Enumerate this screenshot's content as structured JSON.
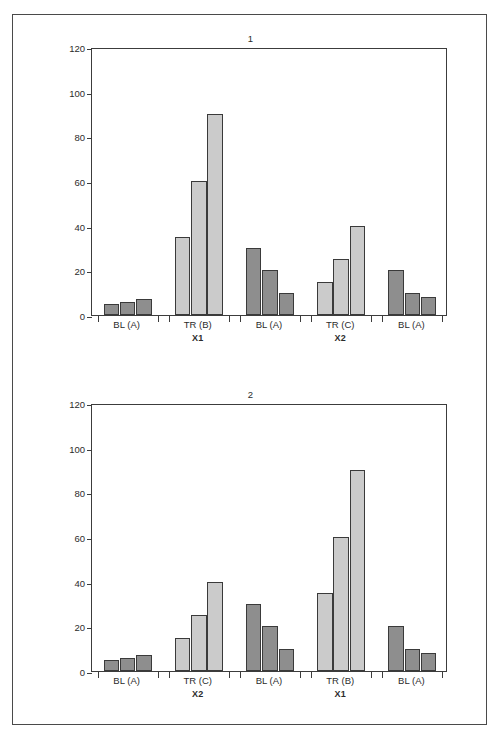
{
  "figure": {
    "panels": [
      {
        "title": "1",
        "y_axis": {
          "min": 0,
          "max": 120,
          "step": 20,
          "ticks": [
            "0",
            "20",
            "40",
            "60",
            "80",
            "100",
            "120"
          ]
        },
        "groups": [
          {
            "label": "BL (A)",
            "sub": "",
            "shade": "dark",
            "values": [
              5,
              6,
              7
            ]
          },
          {
            "label": "TR (B)",
            "sub": "X1",
            "shade": "light",
            "values": [
              35,
              60,
              90
            ]
          },
          {
            "label": "BL (A)",
            "sub": "",
            "shade": "dark",
            "values": [
              30,
              20,
              10
            ]
          },
          {
            "label": "TR (C)",
            "sub": "X2",
            "shade": "light",
            "values": [
              15,
              25,
              40
            ]
          },
          {
            "label": "BL (A)",
            "sub": "",
            "shade": "dark",
            "values": [
              20,
              10,
              8
            ]
          }
        ]
      },
      {
        "title": "2",
        "y_axis": {
          "min": 0,
          "max": 120,
          "step": 20,
          "ticks": [
            "0",
            "20",
            "40",
            "60",
            "80",
            "100",
            "120"
          ]
        },
        "groups": [
          {
            "label": "BL (A)",
            "sub": "",
            "shade": "dark",
            "values": [
              5,
              6,
              7
            ]
          },
          {
            "label": "TR (C)",
            "sub": "X2",
            "shade": "light",
            "values": [
              15,
              25,
              40
            ]
          },
          {
            "label": "BL (A)",
            "sub": "",
            "shade": "dark",
            "values": [
              30,
              20,
              10
            ]
          },
          {
            "label": "TR (B)",
            "sub": "X1",
            "shade": "light",
            "values": [
              35,
              60,
              90
            ]
          },
          {
            "label": "BL (A)",
            "sub": "",
            "shade": "dark",
            "values": [
              20,
              10,
              8
            ]
          }
        ]
      }
    ]
  },
  "colors": {
    "bar_dark": "#8e8e8e",
    "bar_light": "#cbcbcb",
    "bar_edge": "#3a3a3a",
    "axis": "#3c3c3c",
    "frame": "#4a4a4a",
    "background": "#ffffff",
    "text": "#2b2b2b"
  },
  "chart_data": [
    {
      "type": "bar",
      "title": "1",
      "xlabel": "",
      "ylabel": "",
      "ylim": [
        0,
        120
      ],
      "yticks": [
        0,
        20,
        40,
        60,
        80,
        100,
        120
      ],
      "grid": false,
      "legend": "none",
      "categories": [
        "BL (A)",
        "TR (B) / X1",
        "BL (A)",
        "TR (C) / X2",
        "BL (A)"
      ],
      "group_shades": [
        "dark",
        "light",
        "dark",
        "light",
        "dark"
      ],
      "bars_per_group": 3,
      "series": [
        {
          "name": "bar 1",
          "values": [
            5,
            35,
            30,
            15,
            20
          ]
        },
        {
          "name": "bar 2",
          "values": [
            6,
            60,
            20,
            25,
            10
          ]
        },
        {
          "name": "bar 3",
          "values": [
            7,
            90,
            10,
            40,
            8
          ]
        }
      ]
    },
    {
      "type": "bar",
      "title": "2",
      "xlabel": "",
      "ylabel": "",
      "ylim": [
        0,
        120
      ],
      "yticks": [
        0,
        20,
        40,
        60,
        80,
        100,
        120
      ],
      "grid": false,
      "legend": "none",
      "categories": [
        "BL (A)",
        "TR (C) / X2",
        "BL (A)",
        "TR (B) / X1",
        "BL (A)"
      ],
      "group_shades": [
        "dark",
        "light",
        "dark",
        "light",
        "dark"
      ],
      "bars_per_group": 3,
      "series": [
        {
          "name": "bar 1",
          "values": [
            5,
            15,
            30,
            35,
            20
          ]
        },
        {
          "name": "bar 2",
          "values": [
            6,
            25,
            20,
            60,
            10
          ]
        },
        {
          "name": "bar 3",
          "values": [
            7,
            40,
            10,
            90,
            8
          ]
        }
      ]
    }
  ]
}
